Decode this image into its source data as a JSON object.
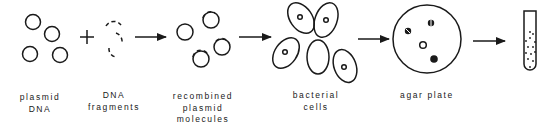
{
  "diagram": {
    "operator": "+",
    "stages": [
      {
        "id": "plasmid-dna",
        "label_lines": [
          "plasmid",
          "DNA"
        ]
      },
      {
        "id": "dna-fragments",
        "label_lines": [
          "DNA",
          "fragments"
        ]
      },
      {
        "id": "recombined-plasmid-molecules",
        "label_lines": [
          "recombined",
          "plasmid",
          "molecules"
        ]
      },
      {
        "id": "bacterial-cells",
        "label_lines": [
          "bacterial",
          "cells"
        ]
      },
      {
        "id": "agar-plate",
        "label_lines": [
          "agar plate"
        ]
      },
      {
        "id": "test-tube",
        "label_lines": []
      }
    ],
    "arrows": [
      "fragments-to-recombined",
      "recombined-to-cells",
      "cells-to-plate",
      "plate-to-tube"
    ],
    "colors": {
      "ink": "#1a1a1a",
      "background": "#ffffff"
    }
  }
}
